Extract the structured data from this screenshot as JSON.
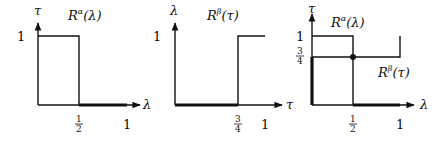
{
  "panels": [
    {
      "id": "alpha",
      "title": "R^α(λ)",
      "title_base": "R",
      "title_sup": "α",
      "title_arg": "(λ)",
      "y_axis_label": "τ",
      "x_axis_label": "λ",
      "y_ticks": [
        "1"
      ],
      "x_ticks": [
        {
          "num": "1",
          "den": "2"
        },
        {
          "label": "1"
        }
      ]
    },
    {
      "id": "beta",
      "title": "R^β(τ)",
      "title_base": "R",
      "title_sup": "β",
      "title_arg": "(τ)",
      "y_axis_label": "λ",
      "x_axis_label": "τ",
      "y_ticks": [
        "1"
      ],
      "x_ticks": [
        {
          "num": "3",
          "den": "4"
        },
        {
          "label": "1"
        }
      ]
    },
    {
      "id": "combined",
      "alpha_label_base": "R",
      "alpha_label_sup": "α",
      "alpha_label_arg": "(λ)",
      "beta_label_base": "R",
      "beta_label_sup": "β",
      "beta_label_arg": "(τ)",
      "y_axis_label": "τ",
      "x_axis_label": "λ",
      "y_ticks": [
        {
          "label": "1"
        },
        {
          "num": "3",
          "den": "4"
        }
      ],
      "x_ticks": [
        {
          "num": "1",
          "den": "2"
        },
        {
          "label": "1"
        }
      ]
    }
  ]
}
